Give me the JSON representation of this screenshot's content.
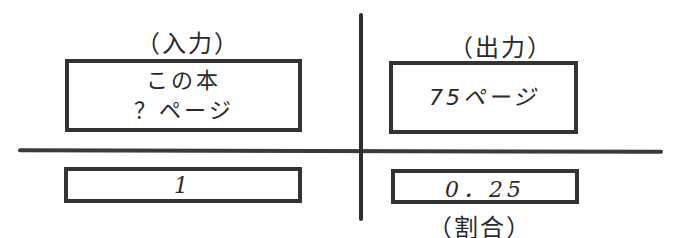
{
  "diagram": {
    "type": "proportion-table",
    "columns": [
      {
        "header": "（入力）",
        "top_box_lines": [
          "この本",
          "？ページ"
        ],
        "bottom_box": "1"
      },
      {
        "header": "（出力）",
        "top_box_lines": [
          "75ページ"
        ],
        "bottom_box": "0．25",
        "footer": "（割合）"
      }
    ],
    "colors": {
      "ink": "#2a2a2a",
      "line": "#333333",
      "background": "#ffffff"
    }
  }
}
